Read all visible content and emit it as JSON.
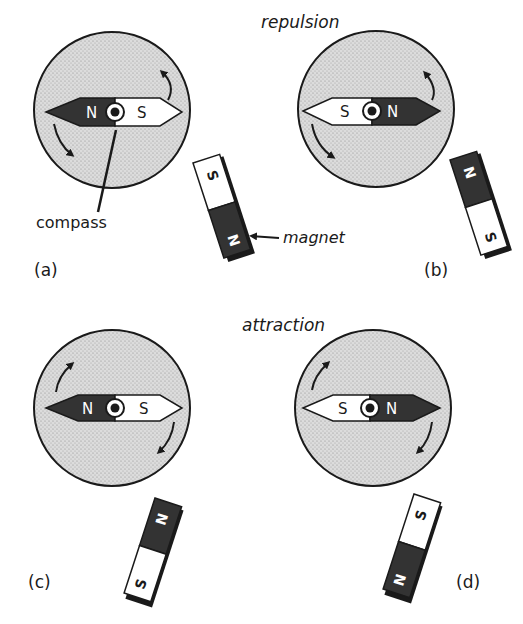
{
  "headings": {
    "top": "repulsion",
    "bottom": "attraction"
  },
  "callouts": {
    "compass": "compass",
    "magnet": "magnet"
  },
  "colors": {
    "dial_fill": "#d4d4d4",
    "dark_pole": "#333333",
    "light_pole": "#ffffff",
    "outline": "#1a1a1a"
  },
  "panels": [
    {
      "id": "a",
      "label": "(a)",
      "group": "repulsion",
      "needle": {
        "left_pole": "N",
        "right_pole": "S"
      },
      "magnet": {
        "top_pole": "S",
        "bottom_pole": "N"
      },
      "rotation": "clockwise"
    },
    {
      "id": "b",
      "label": "(b)",
      "group": "repulsion",
      "needle": {
        "left_pole": "S",
        "right_pole": "N"
      },
      "magnet": {
        "top_pole": "N",
        "bottom_pole": "S"
      },
      "rotation": "counterclockwise"
    },
    {
      "id": "c",
      "label": "(c)",
      "group": "attraction",
      "needle": {
        "left_pole": "N",
        "right_pole": "S"
      },
      "magnet": {
        "top_pole": "N",
        "bottom_pole": "S"
      },
      "rotation": "clockwise"
    },
    {
      "id": "d",
      "label": "(d)",
      "group": "attraction",
      "needle": {
        "left_pole": "S",
        "right_pole": "N"
      },
      "magnet": {
        "top_pole": "S",
        "bottom_pole": "N"
      },
      "rotation": "clockwise"
    }
  ]
}
